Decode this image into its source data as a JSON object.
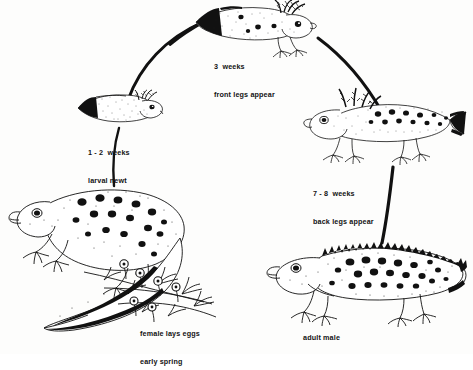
{
  "diagram": {
    "subject": "newt",
    "arrangement": "clockwise circular life cycle",
    "background_color": "#fdfdfc",
    "ink_color": "#111111"
  },
  "stages": [
    {
      "id": "larva",
      "label_lines": [
        "1 - 2  weeks",
        "larval newt",
        "or tadpole"
      ],
      "label_x": 88,
      "label_y": 130,
      "figure_x": 72,
      "figure_y": 88,
      "figure_w": 98,
      "figure_h": 40,
      "facing": "right",
      "features": "tadpole-like larva with feathery external gills, no legs, finned tail"
    },
    {
      "id": "three-weeks",
      "label_lines": [
        "3  weeks",
        "front legs appear"
      ],
      "label_x": 214,
      "label_y": 44,
      "figure_x": 186,
      "figure_y": 0,
      "figure_w": 135,
      "figure_h": 56,
      "facing": "right",
      "features": "larva with front legs developed, large feathery gills, dark finned tail"
    },
    {
      "id": "seven-eight-weeks",
      "label_lines": [
        "7 - 8  weeks",
        "back legs appear"
      ],
      "label_x": 313,
      "label_y": 171,
      "figure_x": 300,
      "figure_y": 90,
      "figure_w": 165,
      "figure_h": 78,
      "facing": "left",
      "features": "larva with front and back legs, external gills, spotted body, finned tail"
    },
    {
      "id": "adult-male",
      "label_lines": [
        "adult male"
      ],
      "label_x": 303,
      "label_y": 315,
      "figure_x": 262,
      "figure_y": 238,
      "figure_w": 205,
      "figure_h": 90,
      "facing": "left",
      "features": "adult male with jagged dorsal crest and heavy dark spots"
    },
    {
      "id": "female",
      "label_lines": [
        "female lays eggs",
        "early spring"
      ],
      "label_x": 140,
      "label_y": 311,
      "figure_x": 8,
      "figure_y": 178,
      "figure_w": 215,
      "figure_h": 160,
      "facing": "left",
      "features": "adult female on pond weed, spotted skin, round eggs attached to plant stems"
    }
  ],
  "arcs": [
    {
      "id": "female-to-larva",
      "from": "female",
      "to": "larva",
      "direction": "upward"
    },
    {
      "id": "larva-to-three-weeks",
      "from": "larva",
      "to": "three-weeks",
      "direction": "upward-right"
    },
    {
      "id": "three-weeks-to-seven-eight",
      "from": "three-weeks",
      "to": "seven-eight-weeks",
      "direction": "downward-right"
    },
    {
      "id": "seven-eight-to-adult",
      "from": "seven-eight-weeks",
      "to": "adult-male",
      "direction": "downward"
    }
  ]
}
